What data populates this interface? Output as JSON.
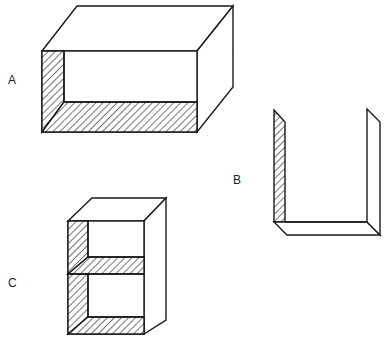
{
  "figure": {
    "type": "line-drawing",
    "stroke_color": "#1a1a1a",
    "background": "#ffffff"
  },
  "labels": {
    "a": "A",
    "b": "B",
    "c": "C"
  },
  "shapes": [
    {
      "id": "A",
      "kind": "open-box-horizontal",
      "hatched_faces": [
        "left-inner-wall",
        "bottom-inner-floor"
      ]
    },
    {
      "id": "B",
      "kind": "u-channel",
      "hatched_faces": [
        "left-inner-wall"
      ]
    },
    {
      "id": "C",
      "kind": "open-shelf-unit-with-middle-shelf",
      "hatched_faces": [
        "left-inner-wall",
        "middle-shelf-top",
        "bottom-inner-floor"
      ]
    }
  ]
}
